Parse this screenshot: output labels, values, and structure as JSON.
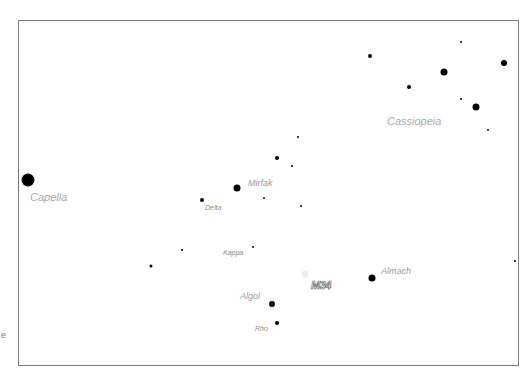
{
  "map": {
    "frame": {
      "left": 18,
      "top": 20,
      "width": 501,
      "height": 346,
      "border_color": "#7a7a7a"
    },
    "edge_label": "e",
    "stars": [
      {
        "name": "Capella",
        "x": 28,
        "y": 180,
        "size": 13
      },
      {
        "name": "Mirfak",
        "x": 237,
        "y": 188,
        "size": 7
      },
      {
        "name": "Delta",
        "x": 202,
        "y": 200,
        "size": 4
      },
      {
        "name": "Kappa",
        "x": 253,
        "y": 247,
        "size": 2
      },
      {
        "name": "Algol",
        "x": 272,
        "y": 304,
        "size": 6
      },
      {
        "name": "Rho",
        "x": 277,
        "y": 323,
        "size": 4
      },
      {
        "name": "Almach",
        "x": 372,
        "y": 278,
        "size": 7
      },
      {
        "name": "",
        "x": 277,
        "y": 158,
        "size": 4
      },
      {
        "name": "",
        "x": 298,
        "y": 137,
        "size": 2
      },
      {
        "name": "",
        "x": 292,
        "y": 166,
        "size": 2
      },
      {
        "name": "",
        "x": 264,
        "y": 198,
        "size": 2
      },
      {
        "name": "",
        "x": 301,
        "y": 206,
        "size": 2
      },
      {
        "name": "",
        "x": 182,
        "y": 250,
        "size": 2
      },
      {
        "name": "",
        "x": 151,
        "y": 266,
        "size": 3
      },
      {
        "name": "",
        "x": 370,
        "y": 56,
        "size": 4
      },
      {
        "name": "",
        "x": 409,
        "y": 87,
        "size": 4
      },
      {
        "name": "",
        "x": 444,
        "y": 72,
        "size": 7
      },
      {
        "name": "",
        "x": 461,
        "y": 42,
        "size": 2
      },
      {
        "name": "",
        "x": 461,
        "y": 99,
        "size": 2
      },
      {
        "name": "",
        "x": 476,
        "y": 107,
        "size": 7
      },
      {
        "name": "",
        "x": 504,
        "y": 63,
        "size": 6
      },
      {
        "name": "",
        "x": 488,
        "y": 130,
        "size": 2
      },
      {
        "name": "",
        "x": 515,
        "y": 261,
        "size": 2
      }
    ],
    "labels": [
      {
        "text": "Capella",
        "x": 30,
        "y": 192,
        "cls": "big"
      },
      {
        "text": "Mirfak",
        "x": 248,
        "y": 179,
        "cls": "med"
      },
      {
        "text": "Delta",
        "x": 205,
        "y": 204,
        "cls": "small"
      },
      {
        "text": "Kappa",
        "x": 223,
        "y": 249,
        "cls": "small"
      },
      {
        "text": "Algol",
        "x": 240,
        "y": 292,
        "cls": "med"
      },
      {
        "text": "Rho",
        "x": 255,
        "y": 325,
        "cls": "small"
      },
      {
        "text": "Almach",
        "x": 381,
        "y": 267,
        "cls": "med"
      },
      {
        "text": "Cassiopeia",
        "x": 387,
        "y": 116,
        "cls": "big"
      }
    ],
    "deep_sky": {
      "name": "M34",
      "x": 305,
      "y": 274,
      "label_x": 311,
      "label_y": 279
    }
  }
}
